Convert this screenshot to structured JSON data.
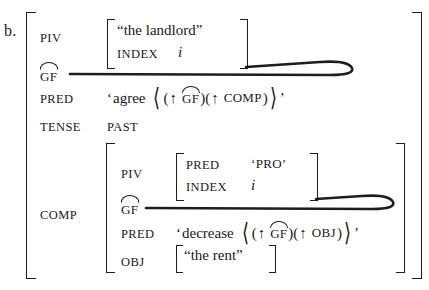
{
  "example": {
    "label": "b."
  },
  "outer_fstructure": {
    "rows": [
      {
        "attribute": "PIV",
        "value_type": "bracket",
        "inner": {
          "rows": [
            {
              "attribute": "",
              "value": "“the landlord”"
            },
            {
              "attribute": "INDEX",
              "value": "i"
            }
          ]
        }
      },
      {
        "attribute": "GF",
        "attribute_note": "GF with overarc (grammaticized discourse function)",
        "value_type": "link-line",
        "value": ""
      },
      {
        "attribute": "PRED",
        "value_type": "predicate",
        "pred_open_quote": "‘",
        "pred_name": "agree",
        "pred_args": [
          {
            "arrow": "↑",
            "label": "GF",
            "arced": true
          },
          {
            "arrow": "↑",
            "label": "COMP",
            "arced": false
          }
        ],
        "pred_close_quote": "’"
      },
      {
        "attribute": "TENSE",
        "value_type": "atom",
        "value": "PAST"
      },
      {
        "attribute": "COMP",
        "value_type": "bracket",
        "inner": {
          "rows": [
            {
              "attribute": "PIV",
              "value_type": "bracket",
              "inner": {
                "rows": [
                  {
                    "attribute": "PRED",
                    "value": "‘PRO’"
                  },
                  {
                    "attribute": "INDEX",
                    "value": "i"
                  }
                ]
              }
            },
            {
              "attribute": "GF",
              "attribute_note": "GF with overarc",
              "value_type": "link-line",
              "value": ""
            },
            {
              "attribute": "PRED",
              "value_type": "predicate",
              "pred_open_quote": "‘",
              "pred_name": "decrease",
              "pred_args": [
                {
                  "arrow": "↑",
                  "label": "GF",
                  "arced": true
                },
                {
                  "arrow": "↑",
                  "label": "OBJ",
                  "arced": false
                }
              ],
              "pred_close_quote": "’"
            },
            {
              "attribute": "OBJ",
              "value_type": "bracket",
              "inner": {
                "rows": [
                  {
                    "attribute": "",
                    "value": "“the rent”"
                  }
                ]
              }
            }
          ]
        }
      }
    ]
  },
  "colors": {
    "ink": "#1d1d1d",
    "paper": "#ffffff"
  }
}
